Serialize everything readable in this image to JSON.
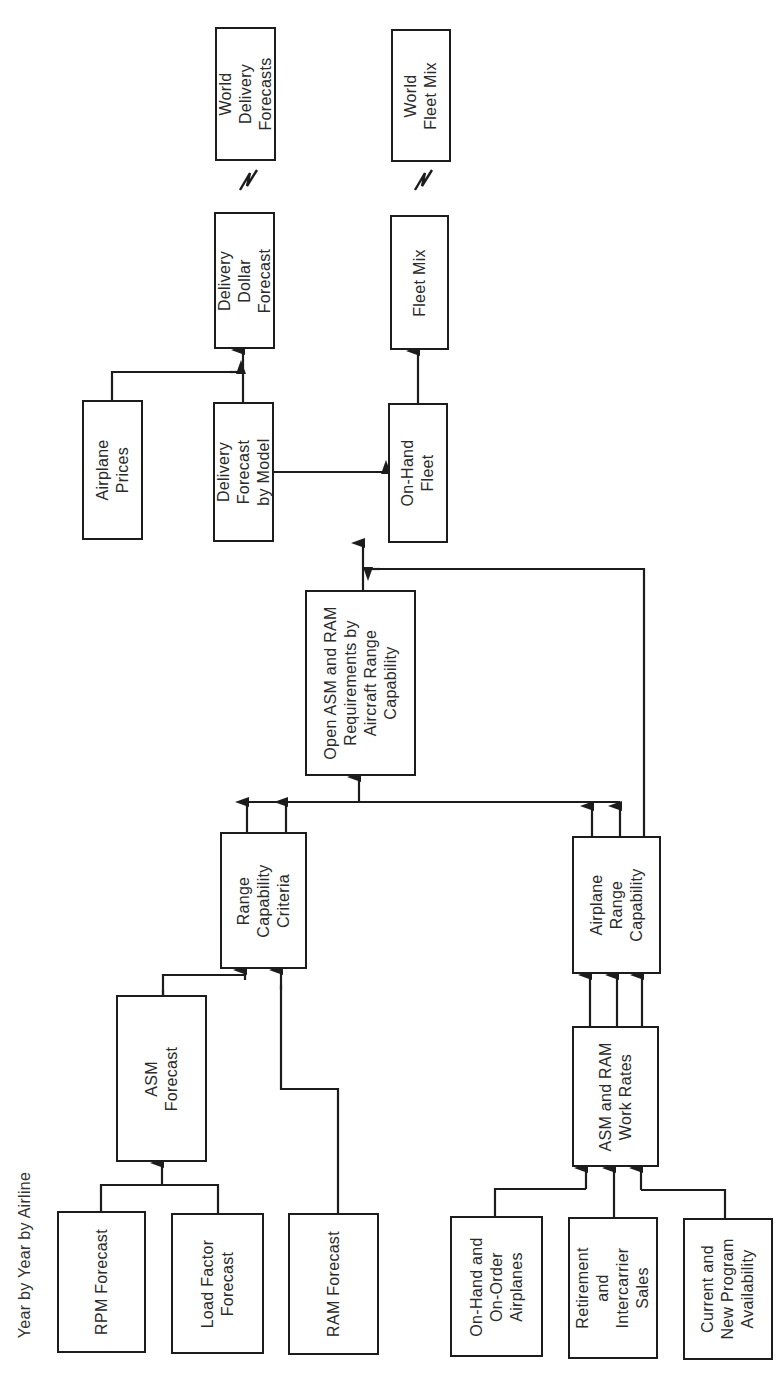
{
  "diagram": {
    "orientation": "rotated-90-ccw",
    "side_label": "Year by Year by Airline",
    "boxes": {
      "world_delivery_forecasts": "World\nDelivery\nForecasts",
      "world_fleet_mix": "World\nFleet Mix",
      "delivery_dollar_forecast": "Delivery\nDollar\nForecast",
      "fleet_mix": "Fleet Mix",
      "airplane_prices": "Airplane\nPrices",
      "delivery_forecast_by_model": "Delivery\nForecast\nby Model",
      "on_hand_fleet": "On-Hand\nFleet",
      "open_asm_ram": "Open ASM and RAM\nRequirements by\nAircraft Range\nCapability",
      "range_capability_criteria": "Range\nCapability\nCriteria",
      "airplane_range_capability": "Airplane\nRange\nCapability",
      "asm_forecast": "ASM\nForecast",
      "asm_ram_work_rates": "ASM and RAM\nWork Rates",
      "rpm_forecast": "RPM Forecast",
      "load_factor_forecast": "Load Factor\nForecast",
      "ram_forecast": "RAM Forecast",
      "on_hand_on_order": "On-Hand and\nOn-Order\nAirplanes",
      "retirement_intercarrier": "Retirement\nand\nIntercarrier\nSales",
      "current_new_program": "Current and\nNew Program\nAvailability"
    },
    "colors": {
      "line": "#1c1c1c",
      "text": "#2a2a2a",
      "background": "#ffffff"
    }
  }
}
